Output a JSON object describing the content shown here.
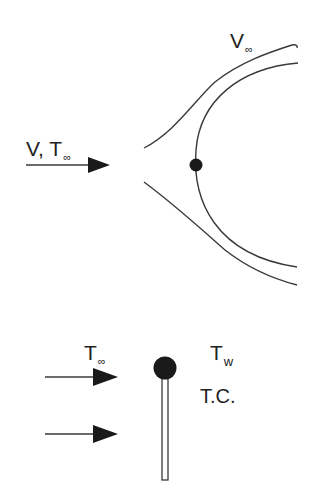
{
  "top_diagram": {
    "freestream_label": {
      "main": "V, T",
      "sub": "∞"
    },
    "outer_label": {
      "main": "V",
      "sub": "∞"
    }
  },
  "bottom_diagram": {
    "ambient_label": {
      "main": "T",
      "sub": "∞"
    },
    "wall_label": {
      "main": "T",
      "sub": "w"
    },
    "thermocouple_label": "T.C."
  },
  "colors": {
    "stroke": "#3a3a3a",
    "fill": "#1a1a1a",
    "background": "#ffffff"
  }
}
